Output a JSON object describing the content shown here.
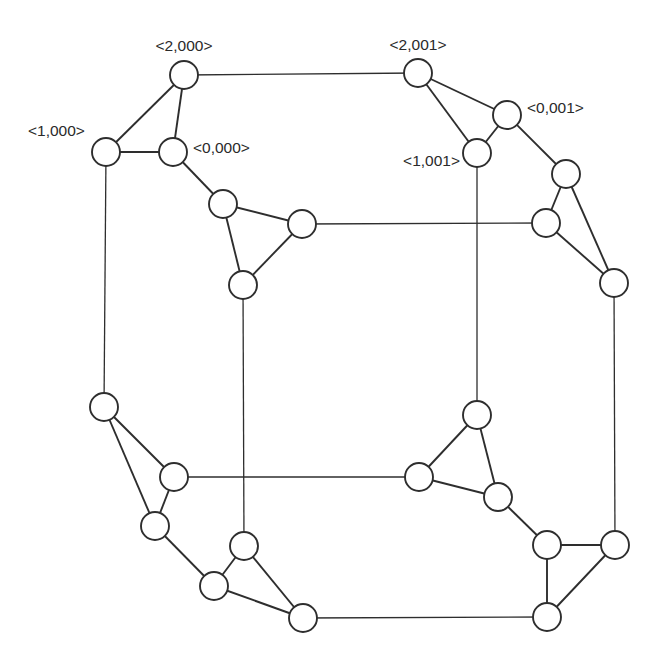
{
  "diagram": {
    "node_radius": 14,
    "colors": {
      "stroke": "#2e2e2e",
      "fill": "#ffffff",
      "text": "#2a2a2a"
    },
    "nodes": [
      {
        "id": "n2000",
        "x": 184,
        "y": 75,
        "label": "<2,000>"
      },
      {
        "id": "n1000",
        "x": 106,
        "y": 152,
        "label": "<1,000>"
      },
      {
        "id": "n0000",
        "x": 173,
        "y": 152,
        "label": "<0,000>"
      },
      {
        "id": "a_tl",
        "x": 223,
        "y": 204,
        "label": ""
      },
      {
        "id": "a_r",
        "x": 302,
        "y": 224,
        "label": ""
      },
      {
        "id": "a_b",
        "x": 243,
        "y": 285,
        "label": ""
      },
      {
        "id": "n2001",
        "x": 418,
        "y": 73,
        "label": "<2,001>"
      },
      {
        "id": "n0001",
        "x": 507,
        "y": 115,
        "label": "<0,001>"
      },
      {
        "id": "n1001",
        "x": 477,
        "y": 153,
        "label": "<1,001>"
      },
      {
        "id": "b_t",
        "x": 566,
        "y": 174,
        "label": ""
      },
      {
        "id": "b_l",
        "x": 546,
        "y": 223,
        "label": ""
      },
      {
        "id": "b_b",
        "x": 614,
        "y": 283,
        "label": ""
      },
      {
        "id": "c_t",
        "x": 104,
        "y": 407,
        "label": ""
      },
      {
        "id": "c_r",
        "x": 174,
        "y": 477,
        "label": ""
      },
      {
        "id": "c_b",
        "x": 155,
        "y": 526,
        "label": ""
      },
      {
        "id": "d_t",
        "x": 244,
        "y": 546,
        "label": ""
      },
      {
        "id": "d_l",
        "x": 214,
        "y": 586,
        "label": ""
      },
      {
        "id": "d_r",
        "x": 303,
        "y": 618,
        "label": ""
      },
      {
        "id": "e_t",
        "x": 477,
        "y": 415,
        "label": ""
      },
      {
        "id": "e_l",
        "x": 419,
        "y": 477,
        "label": ""
      },
      {
        "id": "e_r",
        "x": 498,
        "y": 497,
        "label": ""
      },
      {
        "id": "f_tl",
        "x": 547,
        "y": 545,
        "label": ""
      },
      {
        "id": "f_r",
        "x": 615,
        "y": 545,
        "label": ""
      },
      {
        "id": "f_b",
        "x": 547,
        "y": 617,
        "label": ""
      }
    ],
    "edges": [
      {
        "from": "n2000",
        "to": "n1000",
        "type": "short"
      },
      {
        "from": "n2000",
        "to": "n0000",
        "type": "short"
      },
      {
        "from": "n1000",
        "to": "n0000",
        "type": "short"
      },
      {
        "from": "a_tl",
        "to": "a_r",
        "type": "short"
      },
      {
        "from": "a_tl",
        "to": "a_b",
        "type": "short"
      },
      {
        "from": "a_r",
        "to": "a_b",
        "type": "short"
      },
      {
        "from": "n2001",
        "to": "n0001",
        "type": "short"
      },
      {
        "from": "n2001",
        "to": "n1001",
        "type": "short"
      },
      {
        "from": "n0001",
        "to": "n1001",
        "type": "short"
      },
      {
        "from": "b_t",
        "to": "b_l",
        "type": "short"
      },
      {
        "from": "b_t",
        "to": "b_b",
        "type": "short"
      },
      {
        "from": "b_l",
        "to": "b_b",
        "type": "short"
      },
      {
        "from": "c_t",
        "to": "c_r",
        "type": "short"
      },
      {
        "from": "c_t",
        "to": "c_b",
        "type": "short"
      },
      {
        "from": "c_r",
        "to": "c_b",
        "type": "short"
      },
      {
        "from": "d_t",
        "to": "d_l",
        "type": "short"
      },
      {
        "from": "d_t",
        "to": "d_r",
        "type": "short"
      },
      {
        "from": "d_l",
        "to": "d_r",
        "type": "short"
      },
      {
        "from": "e_t",
        "to": "e_l",
        "type": "short"
      },
      {
        "from": "e_t",
        "to": "e_r",
        "type": "short"
      },
      {
        "from": "e_l",
        "to": "e_r",
        "type": "short"
      },
      {
        "from": "f_tl",
        "to": "f_r",
        "type": "short"
      },
      {
        "from": "f_tl",
        "to": "f_b",
        "type": "short"
      },
      {
        "from": "f_r",
        "to": "f_b",
        "type": "short"
      },
      {
        "from": "n0000",
        "to": "a_tl",
        "type": "short"
      },
      {
        "from": "n0001",
        "to": "b_t",
        "type": "short"
      },
      {
        "from": "c_b",
        "to": "d_l",
        "type": "short"
      },
      {
        "from": "e_r",
        "to": "f_tl",
        "type": "short"
      },
      {
        "from": "n2000",
        "to": "n2001",
        "type": "long"
      },
      {
        "from": "n1000",
        "to": "c_t",
        "type": "long"
      },
      {
        "from": "a_r",
        "to": "b_l",
        "type": "long"
      },
      {
        "from": "a_b",
        "to": "d_t",
        "type": "long"
      },
      {
        "from": "n1001",
        "to": "e_t",
        "type": "long"
      },
      {
        "from": "b_b",
        "to": "f_r",
        "type": "long"
      },
      {
        "from": "c_r",
        "to": "e_l",
        "type": "long"
      },
      {
        "from": "d_r",
        "to": "f_b",
        "type": "long"
      }
    ],
    "labels": [
      {
        "node": "n2000",
        "text": "<2,000>",
        "x": 184,
        "y": 45,
        "anchor": "middle"
      },
      {
        "node": "n1000",
        "text": "<1,000>",
        "x": 28,
        "y": 130,
        "anchor": "start"
      },
      {
        "node": "n0000",
        "text": "<0,000>",
        "x": 193,
        "y": 147,
        "anchor": "start"
      },
      {
        "node": "n2001",
        "text": "<2,001>",
        "x": 418,
        "y": 44,
        "anchor": "middle"
      },
      {
        "node": "n0001",
        "text": "<0,001>",
        "x": 527,
        "y": 107,
        "anchor": "start"
      },
      {
        "node": "n1001",
        "text": "<1,001>",
        "x": 460,
        "y": 160,
        "anchor": "end"
      }
    ]
  }
}
